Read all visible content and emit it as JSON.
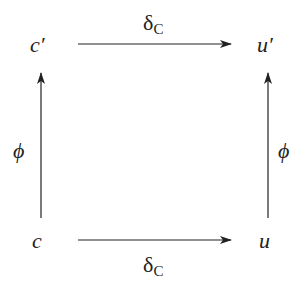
{
  "diagram": {
    "type": "commutative-square",
    "nodes": {
      "top_left": "c′",
      "top_right": "u′",
      "bottom_left": "c",
      "bottom_right": "u"
    },
    "edges": {
      "top": {
        "symbol": "δ",
        "subscript": "C",
        "from": "c′",
        "to": "u′"
      },
      "bottom": {
        "symbol": "δ",
        "subscript": "C",
        "from": "c",
        "to": "u"
      },
      "left": {
        "symbol": "ϕ",
        "from": "c",
        "to": "c′"
      },
      "right": {
        "symbol": "ϕ",
        "from": "u",
        "to": "u′"
      }
    },
    "colors": {
      "ink": "#222222",
      "background": "#ffffff"
    }
  }
}
